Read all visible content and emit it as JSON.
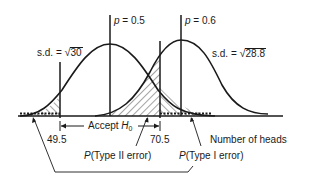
{
  "diagram": {
    "type": "hypothesis-test-normal-curves",
    "axis_label": "Number of heads",
    "curves": [
      {
        "name": "null",
        "p_label": "p",
        "p_value": "= 0.5",
        "sd_prefix": "s.d. = ",
        "sd_radicand": "30"
      },
      {
        "name": "alternative",
        "p_label": "p",
        "p_value": "= 0.6",
        "sd_prefix": "s.d. = ",
        "sd_radicand": "28.8"
      }
    ],
    "critical_values": {
      "lower": "49.5",
      "upper": "70.5"
    },
    "accept_region": {
      "text": "Accept ",
      "symbol": "H",
      "subscript": "0"
    },
    "annotations": {
      "type2": {
        "p": "P",
        "text": "(Type II error)"
      },
      "type1": {
        "p": "P",
        "text": "(Type I error)"
      }
    },
    "colors": {
      "ink": "#1a1a1a",
      "background": "#ffffff"
    }
  }
}
